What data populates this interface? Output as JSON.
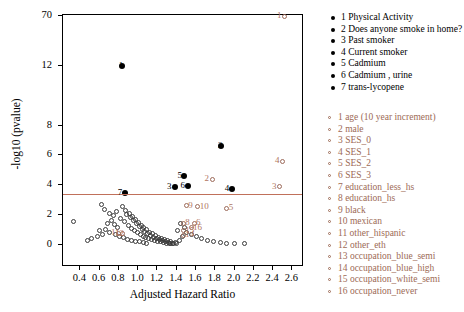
{
  "chart_data": {
    "type": "scatter",
    "title": "",
    "xlabel": "Adjusted Hazard Ratio",
    "ylabel": "-log10 (pvalue)",
    "xlim": [
      0.22,
      2.72
    ],
    "ylim": [
      -1.5,
      71.5
    ],
    "xticks": [
      0.4,
      0.6,
      0.8,
      1.0,
      1.2,
      1.4,
      1.6,
      1.8,
      2.0,
      2.2,
      2.4,
      2.6
    ],
    "xticklabels": [
      "0.4",
      "0.6",
      "0.8",
      "1.0",
      "1.2",
      "1.4",
      "1.6",
      "1.8",
      "2.0",
      "2.2",
      "2.4",
      "2.6"
    ],
    "yticks": [
      0,
      2,
      4,
      6,
      8,
      12,
      70
    ],
    "yticklabels": [
      "0",
      "2",
      "4",
      "6",
      "8",
      "12",
      "70"
    ],
    "grid": false,
    "threshold_line": {
      "y": 3.4,
      "color": "#c0705a"
    },
    "series": [
      {
        "name": "Physical Activity",
        "marker": "filled-black",
        "labels_black": [
          {
            "id": "1",
            "x": 0.83,
            "y": 12.0
          },
          {
            "id": "2",
            "x": 1.86,
            "y": 6.6
          },
          {
            "id": "5",
            "x": 1.44,
            "y": 4.6
          },
          {
            "id": "3",
            "x": 1.33,
            "y": 3.9
          },
          {
            "id": "6",
            "x": 1.47,
            "y": 3.95
          },
          {
            "id": "4",
            "x": 1.93,
            "y": 3.75
          },
          {
            "id": "7",
            "x": 0.82,
            "y": 3.45
          }
        ]
      },
      {
        "name": "covariates",
        "marker": "open-red",
        "labels_red": [
          {
            "id": "1",
            "x": 2.47,
            "y": 70.0
          },
          {
            "id": "4",
            "x": 2.45,
            "y": 5.6
          },
          {
            "id": "2",
            "x": 1.72,
            "y": 4.4
          },
          {
            "id": "3",
            "x": 2.42,
            "y": 3.9
          },
          {
            "id": "9",
            "x": 1.55,
            "y": 2.6
          },
          {
            "id": "10",
            "x": 1.67,
            "y": 2.55
          },
          {
            "id": "5",
            "x": 1.97,
            "y": 2.45
          },
          {
            "id": "8",
            "x": 1.52,
            "y": 1.45
          },
          {
            "id": "6",
            "x": 1.63,
            "y": 1.45
          },
          {
            "id": "16",
            "x": 1.6,
            "y": 1.15
          },
          {
            "id": "15",
            "x": 1.52,
            "y": 0.95
          },
          {
            "id": "14",
            "x": 1.52,
            "y": 0.62
          },
          {
            "id": "12",
            "x": 0.79,
            "y": 0.72
          },
          {
            "id": "11",
            "x": 0.75,
            "y": 0.75
          }
        ]
      }
    ],
    "points_black": [
      {
        "x": 0.83,
        "y": 12.0
      },
      {
        "x": 1.86,
        "y": 6.6
      },
      {
        "x": 1.47,
        "y": 4.6
      },
      {
        "x": 1.38,
        "y": 3.9
      },
      {
        "x": 1.52,
        "y": 3.95
      },
      {
        "x": 1.97,
        "y": 3.75
      },
      {
        "x": 0.86,
        "y": 3.45
      }
    ],
    "points_red_open": [
      {
        "x": 2.52,
        "y": 70.0
      },
      {
        "x": 2.5,
        "y": 5.6
      },
      {
        "x": 1.77,
        "y": 4.4
      },
      {
        "x": 2.47,
        "y": 3.9
      },
      {
        "x": 1.5,
        "y": 2.6
      },
      {
        "x": 1.62,
        "y": 2.55
      },
      {
        "x": 1.92,
        "y": 2.45
      },
      {
        "x": 1.47,
        "y": 1.45
      },
      {
        "x": 1.58,
        "y": 1.45
      },
      {
        "x": 1.55,
        "y": 1.15
      },
      {
        "x": 1.47,
        "y": 0.95
      },
      {
        "x": 1.47,
        "y": 0.62
      },
      {
        "x": 0.84,
        "y": 0.72
      },
      {
        "x": 0.8,
        "y": 0.75
      }
    ],
    "points_open": [
      {
        "x": 0.33,
        "y": 1.55
      },
      {
        "x": 0.62,
        "y": 2.7
      },
      {
        "x": 0.65,
        "y": 2.35
      },
      {
        "x": 0.7,
        "y": 2.1
      },
      {
        "x": 0.74,
        "y": 1.95
      },
      {
        "x": 0.78,
        "y": 2.25
      },
      {
        "x": 0.82,
        "y": 1.75
      },
      {
        "x": 0.86,
        "y": 1.55
      },
      {
        "x": 0.9,
        "y": 1.3
      },
      {
        "x": 0.93,
        "y": 1.1
      },
      {
        "x": 0.96,
        "y": 0.95
      },
      {
        "x": 0.99,
        "y": 0.8
      },
      {
        "x": 1.02,
        "y": 0.7
      },
      {
        "x": 1.05,
        "y": 0.58
      },
      {
        "x": 1.08,
        "y": 0.48
      },
      {
        "x": 1.11,
        "y": 0.4
      },
      {
        "x": 1.14,
        "y": 0.33
      },
      {
        "x": 1.17,
        "y": 0.28
      },
      {
        "x": 1.2,
        "y": 0.22
      },
      {
        "x": 1.23,
        "y": 0.18
      },
      {
        "x": 1.26,
        "y": 0.14
      },
      {
        "x": 1.29,
        "y": 0.1
      },
      {
        "x": 1.32,
        "y": 0.08
      },
      {
        "x": 1.36,
        "y": 0.06
      },
      {
        "x": 0.88,
        "y": 2.05
      },
      {
        "x": 0.92,
        "y": 1.85
      },
      {
        "x": 0.95,
        "y": 1.62
      },
      {
        "x": 0.98,
        "y": 1.42
      },
      {
        "x": 1.01,
        "y": 1.22
      },
      {
        "x": 1.04,
        "y": 1.05
      },
      {
        "x": 1.07,
        "y": 0.9
      },
      {
        "x": 1.1,
        "y": 0.76
      },
      {
        "x": 1.13,
        "y": 0.62
      },
      {
        "x": 1.16,
        "y": 0.5
      },
      {
        "x": 1.19,
        "y": 0.4
      },
      {
        "x": 1.22,
        "y": 0.32
      },
      {
        "x": 1.25,
        "y": 0.25
      },
      {
        "x": 1.28,
        "y": 0.2
      },
      {
        "x": 1.31,
        "y": 0.15
      },
      {
        "x": 1.34,
        "y": 0.11
      },
      {
        "x": 1.37,
        "y": 0.08
      },
      {
        "x": 1.4,
        "y": 0.06
      },
      {
        "x": 0.84,
        "y": 2.55
      },
      {
        "x": 0.87,
        "y": 2.3
      },
      {
        "x": 0.91,
        "y": 2.12
      },
      {
        "x": 0.94,
        "y": 1.9
      },
      {
        "x": 0.97,
        "y": 1.7
      },
      {
        "x": 1.0,
        "y": 1.5
      },
      {
        "x": 1.03,
        "y": 1.32
      },
      {
        "x": 1.06,
        "y": 1.15
      },
      {
        "x": 1.09,
        "y": 1.0
      },
      {
        "x": 1.12,
        "y": 0.85
      },
      {
        "x": 1.15,
        "y": 0.72
      },
      {
        "x": 1.18,
        "y": 0.6
      },
      {
        "x": 1.21,
        "y": 0.5
      },
      {
        "x": 1.24,
        "y": 0.41
      },
      {
        "x": 1.27,
        "y": 0.33
      },
      {
        "x": 1.3,
        "y": 0.26
      },
      {
        "x": 1.33,
        "y": 0.2
      },
      {
        "x": 1.39,
        "y": 0.12
      },
      {
        "x": 1.43,
        "y": 0.3
      },
      {
        "x": 1.46,
        "y": 0.55
      },
      {
        "x": 1.5,
        "y": 0.8
      },
      {
        "x": 0.75,
        "y": 1.35
      },
      {
        "x": 0.79,
        "y": 1.15
      },
      {
        "x": 0.72,
        "y": 1.6
      },
      {
        "x": 0.68,
        "y": 1.4
      },
      {
        "x": 0.66,
        "y": 1.05
      },
      {
        "x": 0.7,
        "y": 0.85
      },
      {
        "x": 0.76,
        "y": 0.7
      },
      {
        "x": 0.81,
        "y": 0.58
      },
      {
        "x": 0.85,
        "y": 0.46
      },
      {
        "x": 0.89,
        "y": 0.38
      },
      {
        "x": 0.93,
        "y": 0.3
      },
      {
        "x": 0.97,
        "y": 0.24
      },
      {
        "x": 1.01,
        "y": 0.18
      },
      {
        "x": 1.05,
        "y": 0.13
      },
      {
        "x": 1.09,
        "y": 0.09
      },
      {
        "x": 0.6,
        "y": 0.95
      },
      {
        "x": 0.63,
        "y": 0.7
      },
      {
        "x": 0.58,
        "y": 0.52
      },
      {
        "x": 1.44,
        "y": 1.45
      },
      {
        "x": 1.48,
        "y": 1.15
      },
      {
        "x": 1.41,
        "y": 0.95
      },
      {
        "x": 1.55,
        "y": 0.7
      },
      {
        "x": 1.6,
        "y": 0.55
      },
      {
        "x": 1.66,
        "y": 0.42
      },
      {
        "x": 1.72,
        "y": 0.3
      },
      {
        "x": 1.78,
        "y": 0.22
      },
      {
        "x": 1.85,
        "y": 0.16
      },
      {
        "x": 0.52,
        "y": 0.4
      },
      {
        "x": 0.47,
        "y": 0.28
      },
      {
        "x": 1.92,
        "y": 0.1
      },
      {
        "x": 2.0,
        "y": 0.08
      },
      {
        "x": 2.1,
        "y": 0.06
      }
    ]
  },
  "legend_black": {
    "items": [
      {
        "id": "1",
        "label": "Physical Activity"
      },
      {
        "id": "2",
        "label": "Does anyone smoke in home?"
      },
      {
        "id": "3",
        "label": "Past smoker"
      },
      {
        "id": "4",
        "label": "Current smoker"
      },
      {
        "id": "5",
        "label": "Cadmium"
      },
      {
        "id": "6",
        "label": "Cadmium , urine"
      },
      {
        "id": "7",
        "label": "trans-lycopene"
      }
    ]
  },
  "legend_red": {
    "items": [
      {
        "id": "1",
        "label": "age (10 year increment)"
      },
      {
        "id": "2",
        "label": "male"
      },
      {
        "id": "3",
        "label": "SES_0"
      },
      {
        "id": "4",
        "label": "SES_1"
      },
      {
        "id": "5",
        "label": "SES_2"
      },
      {
        "id": "6",
        "label": "SES_3"
      },
      {
        "id": "7",
        "label": "education_less_hs"
      },
      {
        "id": "8",
        "label": "education_hs"
      },
      {
        "id": "9",
        "label": "black"
      },
      {
        "id": "10",
        "label": "mexican"
      },
      {
        "id": "11",
        "label": "other_hispanic"
      },
      {
        "id": "12",
        "label": "other_eth"
      },
      {
        "id": "13",
        "label": "occupation_blue_semi"
      },
      {
        "id": "14",
        "label": "occupation_blue_high"
      },
      {
        "id": "15",
        "label": "occupation_white_semi"
      },
      {
        "id": "16",
        "label": "occupation_never"
      }
    ]
  },
  "colors": {
    "accent_red": "#9d6a55",
    "threshold": "#c0705a",
    "point_black": "#000000",
    "point_open": "#3a3a3a"
  }
}
